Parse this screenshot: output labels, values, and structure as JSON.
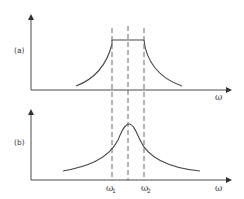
{
  "diagram": {
    "panel_a": {
      "label": "(a)",
      "x_axis_label": "ω",
      "description": "Rectangular flat-topped spectrum between ω1 and ω2 with decaying tails"
    },
    "panel_b": {
      "label": "(b)",
      "x_axis_label": "ω",
      "description": "Resonance peak centered between ω1 and ω2 with decaying tails",
      "tick_labels": [
        {
          "symbol": "ω",
          "subscript": "1"
        },
        {
          "symbol": "ω",
          "subscript": "2"
        }
      ]
    },
    "colors": {
      "line": "#4a4a4a",
      "dashed": "#6a6a6a",
      "background": "#ffffff"
    }
  }
}
